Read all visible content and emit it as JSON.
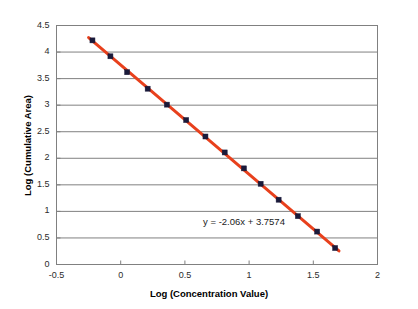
{
  "chart_data": {
    "type": "scatter",
    "title": "",
    "xlabel": "Log (Concentration Value)",
    "ylabel": "Log (Cumulative Area)",
    "xlim": [
      -0.5,
      2
    ],
    "ylim": [
      0,
      4.5
    ],
    "xticks": [
      "-0.5",
      "0",
      "0.5",
      "1",
      "1.5",
      "2"
    ],
    "xtick_values": [
      -0.5,
      0,
      0.5,
      1,
      1.5,
      2
    ],
    "yticks": [
      "0",
      "0.5",
      "1",
      "1.5",
      "2",
      "2.5",
      "3",
      "3.5",
      "4",
      "4.5"
    ],
    "ytick_values": [
      0,
      0.5,
      1,
      1.5,
      2,
      2.5,
      3,
      3.5,
      4,
      4.5
    ],
    "grid": "horizontal",
    "legend": "none",
    "marker_color": "#1a1a3a",
    "line_color": "#e8401c",
    "gridline_color": "#808080",
    "border_color": "#808080",
    "series": [
      {
        "name": "Calibration",
        "x": [
          -0.22,
          -0.08,
          0.05,
          0.21,
          0.36,
          0.51,
          0.66,
          0.81,
          0.96,
          1.09,
          1.23,
          1.38,
          1.53,
          1.67
        ],
        "y": [
          4.22,
          3.92,
          3.62,
          3.31,
          3.01,
          2.72,
          2.41,
          2.11,
          1.81,
          1.52,
          1.22,
          0.91,
          0.62,
          0.31
        ]
      }
    ],
    "trendline": {
      "slope": -2.06,
      "intercept": 3.7574,
      "equation": "y = -2.06x + 3.7574",
      "label_x": 1.07,
      "label_y": 0.78
    }
  }
}
